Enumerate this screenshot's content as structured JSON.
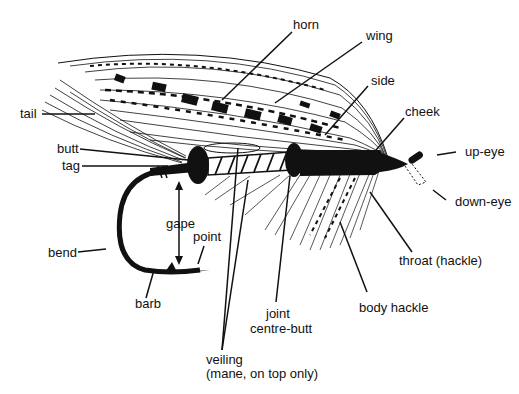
{
  "diagram": {
    "colors": {
      "ink": "#111111",
      "background": "#ffffff"
    },
    "labels": {
      "horn": "horn",
      "wing": "wing",
      "side": "side",
      "cheek": "cheek",
      "up_eye": "up-eye",
      "down_eye": "down-eye",
      "tail": "tail",
      "butt": "butt",
      "tag": "tag",
      "gape": "gape",
      "point": "point",
      "bend": "bend",
      "barb": "barb",
      "throat": "throat (hackle)",
      "body_hackle": "body hackle",
      "joint": "joint",
      "centre_butt": "centre-butt",
      "veiling": "veiling",
      "veiling_note": "(mane, on top only)"
    }
  }
}
